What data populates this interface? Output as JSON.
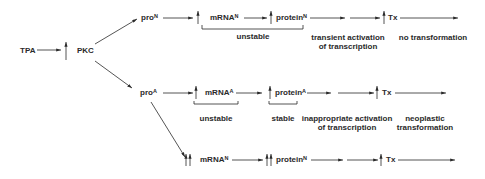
{
  "diagram": {
    "source": {
      "tpa": "TPA",
      "pkc": "PKC"
    },
    "normal_path": {
      "promoter": "pro",
      "promoter_sup": "N",
      "mrna": "mRNA",
      "mrna_sup": "N",
      "protein": "protein",
      "protein_sup": "N",
      "tx": "Tx",
      "bracket_label": "unstable",
      "activation_line1": "transient activation",
      "activation_line2": "of transcription",
      "outcome": "no transformation"
    },
    "activated_path": {
      "promoter": "pro",
      "promoter_sup": "A",
      "mrna": "mRNA",
      "mrna_sup": "A",
      "protein": "protein",
      "protein_sup": "A",
      "tx": "Tx",
      "mrna_label": "unstable",
      "protein_label": "stable",
      "activation_line1": "inappropriate activation",
      "activation_line2": "of transcription",
      "outcome_line1": "neoplastic",
      "outcome_line2": "transformation"
    },
    "overexpressed_path": {
      "mrna": "mRNA",
      "mrna_sup": "N",
      "protein": "protein",
      "protein_sup": "N",
      "tx": "Tx"
    },
    "colors": {
      "ink": "#2a2a2a",
      "background": "#ffffff"
    }
  }
}
